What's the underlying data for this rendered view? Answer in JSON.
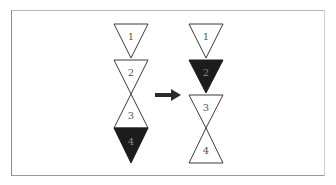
{
  "diagram": {
    "title": "",
    "colors": {
      "outline": "#3a3a3a",
      "filled": "#1c1c1c",
      "empty": "#ffffff",
      "label_dark": "#555555",
      "label_light": "#8a8a8a",
      "arrow": "#2a2a2a"
    },
    "before": {
      "triangles": [
        {
          "label": "1",
          "direction": "down",
          "filled": false
        },
        {
          "label": "2",
          "direction": "down",
          "filled": false
        },
        {
          "label": "3",
          "direction": "up",
          "filled": false
        },
        {
          "label": "4",
          "direction": "down",
          "filled": true
        }
      ]
    },
    "arrow": {
      "direction": "right"
    },
    "after": {
      "triangles": [
        {
          "label": "1",
          "direction": "down",
          "filled": false
        },
        {
          "label": "2",
          "direction": "down",
          "filled": true
        },
        {
          "label": "3",
          "direction": "down",
          "filled": false
        },
        {
          "label": "4",
          "direction": "up",
          "filled": false
        }
      ]
    }
  }
}
